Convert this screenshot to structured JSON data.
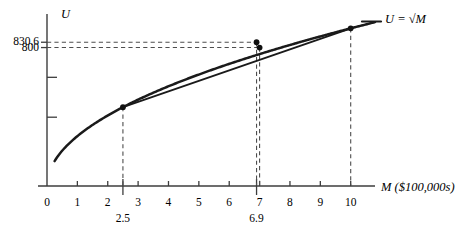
{
  "figure": {
    "y_axis_name": "U",
    "x_axis_name": "M ($100,000s)",
    "curve_label": "U = √M"
  },
  "chart_data": {
    "type": "line",
    "title": "",
    "subtitle": "",
    "xlabel": "M ($100,000s)",
    "ylabel": "U",
    "grid": false,
    "legend": "none",
    "xlim": [
      0,
      10.8
    ],
    "ylim": [
      0,
      3.45
    ],
    "x_ticks": [
      "0",
      "1",
      "2",
      "3",
      "4",
      "5",
      "6",
      "7",
      "8",
      "9",
      "10"
    ],
    "x_tick_values": [
      0,
      1,
      2,
      3,
      4,
      5,
      6,
      7,
      8,
      9,
      10
    ],
    "x_extra_ticks": [
      {
        "label": "2.5",
        "value": 2.5
      },
      {
        "label": "6.9",
        "value": 6.9
      }
    ],
    "y_ticks": [
      "830.6",
      "800"
    ],
    "y_tick_values": [
      2.8836,
      2.7768
    ],
    "y_unlabeled_ticks": [
      2.18,
      1.38
    ],
    "series": [
      {
        "name": "U = √M",
        "type": "curve",
        "formula": "sqrt",
        "x_start": 0.25,
        "x_end": 10.8
      },
      {
        "name": "chord",
        "type": "segment",
        "x": [
          2.5,
          10
        ],
        "y": [
          1.5811,
          3.1623
        ]
      }
    ],
    "points": [
      {
        "name": "tangency-start",
        "x": 2.5,
        "y": 1.5811,
        "on": "curve"
      },
      {
        "name": "expected-utility",
        "x": 6.9,
        "y": 2.8836,
        "on": "curve",
        "y_label": "830.6"
      },
      {
        "name": "certainty-equivalent",
        "x": 7.0,
        "y": 2.7768,
        "on": "chord",
        "y_label": "800"
      },
      {
        "name": "endpoint",
        "x": 10,
        "y": 3.1623,
        "on": "curve"
      }
    ],
    "annotations": [
      {
        "text": "830.6",
        "type": "y-dashed-guide",
        "y": 2.8836,
        "to_x": 6.9
      },
      {
        "text": "800",
        "type": "y-dashed-guide",
        "y": 2.7768,
        "to_x": 7.0
      },
      {
        "text": "2.5",
        "type": "x-dashed-guide",
        "x": 2.5
      },
      {
        "text": "6.9",
        "type": "x-dashed-guide",
        "x": 6.9
      },
      {
        "text": "7",
        "type": "x-dashed-guide",
        "x": 7.0
      },
      {
        "text": "10",
        "type": "x-dashed-guide",
        "x": 10
      }
    ]
  },
  "colors": {
    "curve": "#1a1a1a",
    "axis": "#3d3d3d",
    "dashed": "#4d4d4d",
    "text": "#000000"
  }
}
